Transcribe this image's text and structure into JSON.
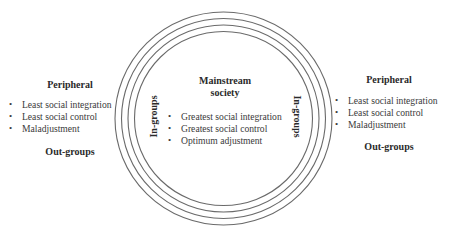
{
  "diagram": {
    "ring_color": "#6a6a6a",
    "rings": {
      "cx": 223.5,
      "cy": 118.5,
      "radii": [
        107,
        100.5,
        94,
        87.5
      ],
      "count": 4
    },
    "left": {
      "title": "Peripheral",
      "items": [
        "Least social integration",
        "Least social control",
        "Maladjustment"
      ],
      "footer": "Out-groups"
    },
    "center": {
      "title_line1": "Mainstream",
      "title_line2": "society",
      "items": [
        "Greatest social integration",
        "Greatest social control",
        "Optimum adjustment"
      ]
    },
    "right": {
      "title": "Peripheral",
      "items": [
        "Least social integration",
        "Least social control",
        "Maladjustment"
      ],
      "footer": "Out-groups"
    },
    "ring_label_left": "In-groups",
    "ring_label_right": "In-groups"
  }
}
